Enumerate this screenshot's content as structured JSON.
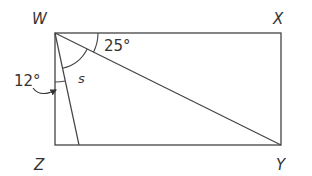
{
  "diagram": {
    "type": "geometry",
    "shape": "rectangle",
    "vertices": {
      "W": {
        "label": "W",
        "x": 55,
        "y": 33
      },
      "X": {
        "label": "X",
        "x": 281,
        "y": 33
      },
      "Y": {
        "label": "Y",
        "x": 281,
        "y": 145
      },
      "Z": {
        "label": "Z",
        "x": 55,
        "y": 145
      }
    },
    "segments": [
      {
        "from": "W",
        "to": "X"
      },
      {
        "from": "X",
        "to": "Y"
      },
      {
        "from": "Y",
        "to": "Z"
      },
      {
        "from": "Z",
        "to": "W"
      },
      {
        "from": "W",
        "to": "Y",
        "name": "diagonal"
      },
      {
        "from": "W",
        "to": "P",
        "name": "slanted-line",
        "note": "P on ZY near Z"
      }
    ],
    "angles": {
      "angle_xwy": {
        "label": "25°"
      },
      "angle_s": {
        "label": "s"
      },
      "angle_zwp": {
        "label": "12°"
      }
    },
    "colors": {
      "line": "#444444",
      "text": "#333333",
      "background": "#ffffff"
    }
  }
}
